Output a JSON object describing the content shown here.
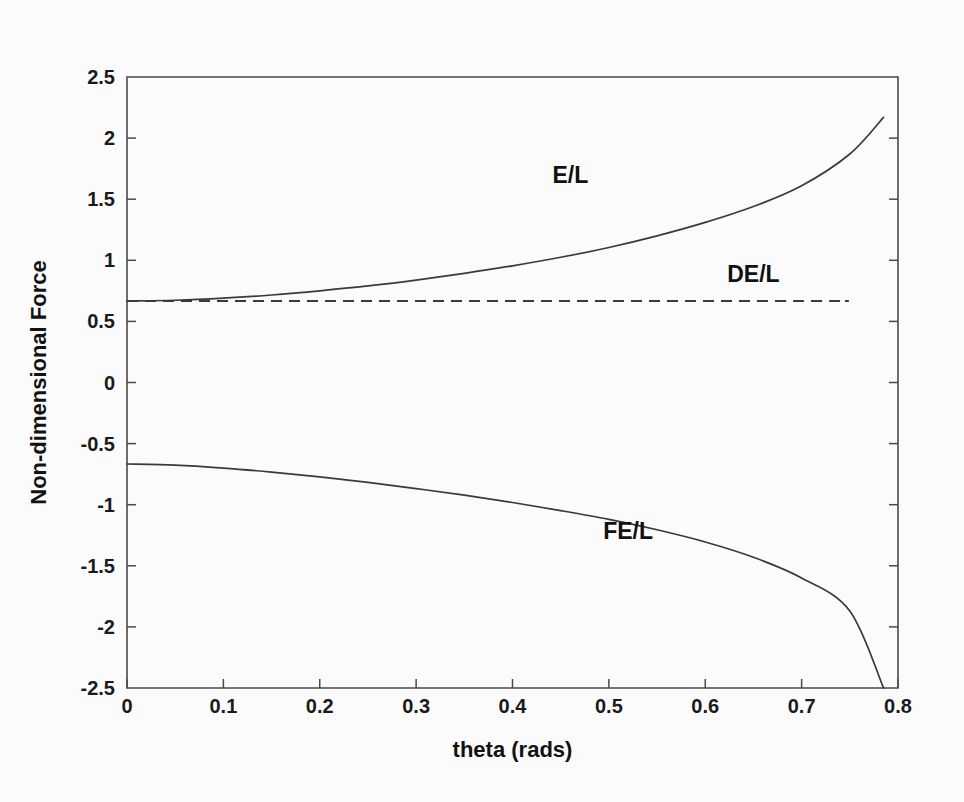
{
  "figure": {
    "background_color": "#fbfbfb",
    "ink_color": "#3a3a3a"
  },
  "chart_data": {
    "type": "line",
    "title": "",
    "subtitle": "",
    "xlabel": "theta (rads)",
    "ylabel": "Non-dimensional Force",
    "xlim": [
      0,
      0.8
    ],
    "ylim": [
      -2.5,
      2.5
    ],
    "xticks": [
      0,
      0.1,
      0.2,
      0.3,
      0.4,
      0.5,
      0.6,
      0.7,
      0.8
    ],
    "xticklabels": [
      "0",
      "0.1",
      "0.2",
      "0.3",
      "0.4",
      "0.5",
      "0.6",
      "0.7",
      "0.8"
    ],
    "yticks": [
      -2.5,
      -2,
      -1.5,
      -1,
      -0.5,
      0,
      0.5,
      1,
      1.5,
      2,
      2.5
    ],
    "yticklabels": [
      "-2.5",
      "-2",
      "-1.5",
      "-1",
      "-0.5",
      "0",
      "0.5",
      "1",
      "1.5",
      "2",
      "2.5"
    ],
    "grid": false,
    "legend": "inline-annotations",
    "legend_position": "inline",
    "x": [
      0,
      0.05,
      0.1,
      0.15,
      0.2,
      0.25,
      0.3,
      0.35,
      0.4,
      0.45,
      0.5,
      0.55,
      0.6,
      0.65,
      0.7,
      0.75,
      0.785
    ],
    "series": [
      {
        "name": "E/L",
        "style": "solid",
        "label_position": {
          "x": 0.46,
          "y": 1.63
        },
        "values": [
          0.667,
          0.673,
          0.69,
          0.716,
          0.75,
          0.79,
          0.838,
          0.893,
          0.955,
          1.025,
          1.105,
          1.2,
          1.31,
          1.44,
          1.61,
          1.87,
          2.17
        ]
      },
      {
        "name": "DE/L",
        "style": "dashed",
        "label_position": {
          "x": 0.65,
          "y": 0.82
        },
        "values": [
          0.667,
          0.667,
          0.667,
          0.667,
          0.667,
          0.667,
          0.667,
          0.667,
          0.667,
          0.667,
          0.667,
          0.667,
          0.667,
          0.667,
          0.667,
          0.667,
          0.667
        ],
        "x_end": 0.745
      },
      {
        "name": "FE/L",
        "style": "solid",
        "label_position": {
          "x": 0.52,
          "y": -1.28
        },
        "values": [
          -0.667,
          -0.676,
          -0.7,
          -0.733,
          -0.773,
          -0.818,
          -0.868,
          -0.922,
          -0.982,
          -1.048,
          -1.12,
          -1.205,
          -1.305,
          -1.43,
          -1.6,
          -1.87,
          -2.5
        ]
      }
    ],
    "annotations": [
      {
        "text": "E/L",
        "x": 0.46,
        "y": 1.63
      },
      {
        "text": "DE/L",
        "x": 0.65,
        "y": 0.82
      },
      {
        "text": "FE/L",
        "x": 0.52,
        "y": -1.28
      }
    ]
  }
}
